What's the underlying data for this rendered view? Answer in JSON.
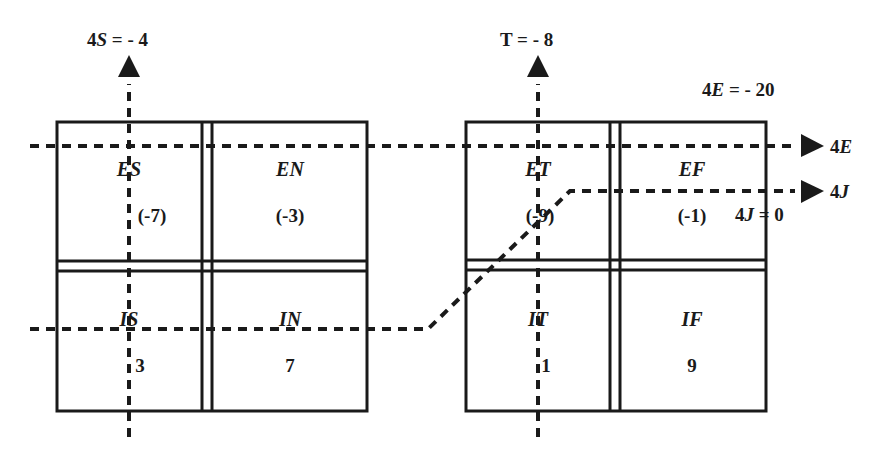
{
  "diagram": {
    "axes": {
      "s_axis": {
        "var": "S",
        "prefix": "4",
        "equals": "= - 4"
      },
      "t_axis": {
        "label": "T = - 8"
      },
      "e_axis": {
        "var": "E",
        "prefix": "4",
        "equals": "= - 20",
        "arrow_label_prefix": "4",
        "arrow_label_var": "E"
      },
      "j_axis": {
        "var": "J",
        "prefix": "4",
        "equals": "= 0",
        "arrow_label_prefix": "4",
        "arrow_label_var": "J"
      }
    },
    "left_grid": {
      "cells": [
        {
          "label": "ES",
          "value": "(-7)"
        },
        {
          "label": "EN",
          "value": "(-3)"
        },
        {
          "label": "IS",
          "value": "3"
        },
        {
          "label": "IN",
          "value": "7"
        }
      ]
    },
    "right_grid": {
      "cells": [
        {
          "label": "ET",
          "value": "(-9)"
        },
        {
          "label": "EF",
          "value": "(-1)"
        },
        {
          "label": "IT",
          "value": "1"
        },
        {
          "label": "IF",
          "value": "9"
        }
      ]
    },
    "colors": {
      "ink": "#1a1a1a",
      "background": "#ffffff"
    }
  }
}
